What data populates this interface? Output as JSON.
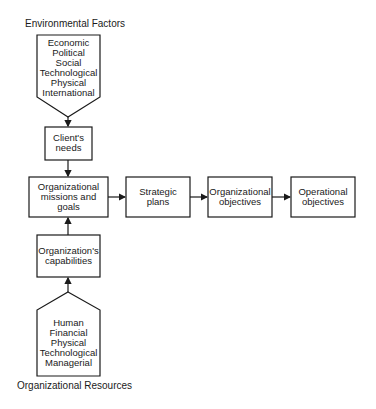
{
  "diagram": {
    "environmental_factors": {
      "title": "Environmental Factors",
      "items": [
        "Economic",
        "Political",
        "Social",
        "Technological",
        "Physical",
        "International"
      ]
    },
    "organizational_resources": {
      "title": "Organizational Resources",
      "items": [
        "Human",
        "Financial",
        "Physical",
        "Technological",
        "Managerial"
      ]
    },
    "nodes": {
      "clients_needs": [
        "Client's",
        "needs"
      ],
      "missions_goals": [
        "Organizational",
        "missions and",
        "goals"
      ],
      "capabilities": [
        "Organization's",
        "capabilities"
      ],
      "strategic_plans": [
        "Strategic",
        "plans"
      ],
      "org_objectives": [
        "Organizational",
        "objectives"
      ],
      "operational_objectives": [
        "Operational",
        "objectives"
      ]
    },
    "edges": [
      {
        "from": "environmental_factors",
        "to": "clients_needs"
      },
      {
        "from": "clients_needs",
        "to": "missions_goals"
      },
      {
        "from": "capabilities",
        "to": "missions_goals"
      },
      {
        "from": "organizational_resources",
        "to": "capabilities"
      },
      {
        "from": "missions_goals",
        "to": "strategic_plans"
      },
      {
        "from": "strategic_plans",
        "to": "org_objectives"
      },
      {
        "from": "org_objectives",
        "to": "operational_objectives"
      }
    ],
    "colors": {
      "stroke": "#1a1a1a",
      "background": "#ffffff"
    }
  }
}
